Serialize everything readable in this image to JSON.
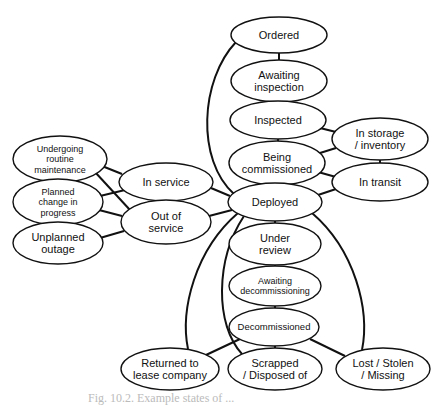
{
  "diagram": {
    "type": "state-diagram",
    "nodes": [
      {
        "id": "ordered",
        "lines": [
          "Ordered"
        ],
        "cx": 279,
        "cy": 35,
        "rx": 48,
        "ry": 18,
        "fs": 11
      },
      {
        "id": "awaiting-inspection",
        "lines": [
          "Awaiting",
          "inspection"
        ],
        "cx": 279,
        "cy": 81,
        "rx": 48,
        "ry": 21,
        "fs": 11
      },
      {
        "id": "inspected",
        "lines": [
          "Inspected"
        ],
        "cx": 278,
        "cy": 120,
        "rx": 48,
        "ry": 19,
        "fs": 11
      },
      {
        "id": "being-commissioned",
        "lines": [
          "Being",
          "commissioned"
        ],
        "cx": 277,
        "cy": 163,
        "rx": 48,
        "ry": 22,
        "fs": 11
      },
      {
        "id": "deployed",
        "lines": [
          "Deployed"
        ],
        "cx": 275,
        "cy": 202,
        "rx": 47,
        "ry": 19,
        "fs": 11
      },
      {
        "id": "in-storage",
        "lines": [
          "In storage",
          "/ inventory"
        ],
        "cx": 380,
        "cy": 139,
        "rx": 48,
        "ry": 21,
        "fs": 11
      },
      {
        "id": "in-transit",
        "lines": [
          "In transit"
        ],
        "cx": 380,
        "cy": 182,
        "rx": 48,
        "ry": 19,
        "fs": 11
      },
      {
        "id": "in-service",
        "lines": [
          "In service"
        ],
        "cx": 166,
        "cy": 182,
        "rx": 47,
        "ry": 19,
        "fs": 11
      },
      {
        "id": "out-of-service",
        "lines": [
          "Out of",
          "service"
        ],
        "cx": 166,
        "cy": 222,
        "rx": 45,
        "ry": 22,
        "fs": 11
      },
      {
        "id": "undergoing-maintenance",
        "lines": [
          "Undergoing",
          "routine",
          "maintenance"
        ],
        "cx": 60,
        "cy": 159,
        "rx": 47,
        "ry": 23,
        "fs": 9
      },
      {
        "id": "planned-change",
        "lines": [
          "Planned",
          "change in",
          "progress"
        ],
        "cx": 58,
        "cy": 202,
        "rx": 45,
        "ry": 23,
        "fs": 9
      },
      {
        "id": "unplanned-outage",
        "lines": [
          "Unplanned",
          "outage"
        ],
        "cx": 58,
        "cy": 243,
        "rx": 45,
        "ry": 21,
        "fs": 11
      },
      {
        "id": "under-review",
        "lines": [
          "Under",
          "review"
        ],
        "cx": 275,
        "cy": 244,
        "rx": 46,
        "ry": 21,
        "fs": 11
      },
      {
        "id": "awaiting-decommissioning",
        "lines": [
          "Awaiting",
          "decommissioning"
        ],
        "cx": 275,
        "cy": 286,
        "rx": 46,
        "ry": 20,
        "fs": 9
      },
      {
        "id": "decommissioned",
        "lines": [
          "Decommissioned"
        ],
        "cx": 274,
        "cy": 327,
        "rx": 45,
        "ry": 19,
        "fs": 9.5
      },
      {
        "id": "returned",
        "lines": [
          "Returned to",
          "lease company"
        ],
        "cx": 170,
        "cy": 369,
        "rx": 49,
        "ry": 21,
        "fs": 11
      },
      {
        "id": "scrapped",
        "lines": [
          "Scrapped",
          "/ Disposed of"
        ],
        "cx": 275,
        "cy": 369,
        "rx": 47,
        "ry": 21,
        "fs": 11
      },
      {
        "id": "lost",
        "lines": [
          "Lost / Stolen",
          "/ Missing"
        ],
        "cx": 383,
        "cy": 369,
        "rx": 47,
        "ry": 21,
        "fs": 11
      }
    ],
    "edges": [
      {
        "from": "ordered",
        "to": "awaiting-inspection"
      },
      {
        "from": "awaiting-inspection",
        "to": "inspected"
      },
      {
        "from": "inspected",
        "to": "being-commissioned"
      },
      {
        "from": "being-commissioned",
        "to": "deployed"
      },
      {
        "from": "inspected",
        "to": "in-storage"
      },
      {
        "from": "being-commissioned",
        "to": "in-storage"
      },
      {
        "from": "in-storage",
        "to": "in-transit"
      },
      {
        "from": "being-commissioned",
        "to": "in-transit"
      },
      {
        "from": "deployed",
        "to": "in-transit"
      },
      {
        "from": "deployed",
        "to": "in-service"
      },
      {
        "from": "deployed",
        "to": "out-of-service"
      },
      {
        "from": "in-service",
        "to": "undergoing-maintenance"
      },
      {
        "from": "in-service",
        "to": "planned-change"
      },
      {
        "from": "out-of-service",
        "to": "undergoing-maintenance"
      },
      {
        "from": "out-of-service",
        "to": "planned-change"
      },
      {
        "from": "out-of-service",
        "to": "unplanned-outage"
      },
      {
        "from": "deployed",
        "to": "under-review"
      },
      {
        "from": "under-review",
        "to": "awaiting-decommissioning"
      },
      {
        "from": "awaiting-decommissioning",
        "to": "decommissioned"
      },
      {
        "from": "decommissioned",
        "to": "returned"
      },
      {
        "from": "decommissioned",
        "to": "scrapped"
      },
      {
        "from": "decommissioned",
        "to": "lost"
      },
      {
        "from": "ordered",
        "to": "deployed",
        "curved": true
      },
      {
        "from": "deployed",
        "to": "returned",
        "curved": true
      },
      {
        "from": "deployed",
        "to": "scrapped",
        "curved": true
      },
      {
        "from": "deployed",
        "to": "lost",
        "curved": true
      }
    ],
    "caption": "Fig. 10.2. Example states of ..."
  }
}
